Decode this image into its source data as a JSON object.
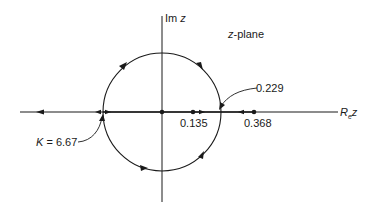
{
  "diagram": {
    "title": "z-plane",
    "title_italic_part": "z",
    "title_rest": "-plane",
    "axes": {
      "imag_label": "Im z",
      "imag_label_main": "Im",
      "imag_label_var": "z",
      "real_label_main": "R",
      "real_label_sub": "e",
      "real_label_var": "z"
    },
    "annotations": {
      "breakaway": "0.229",
      "zero": "0.135",
      "pole": "0.368",
      "gain_label": "K = 6.67",
      "gain_var": "K",
      "gain_value": " = 6.67"
    },
    "colors": {
      "line": "#1a1a1a",
      "background": "#ffffff"
    }
  }
}
